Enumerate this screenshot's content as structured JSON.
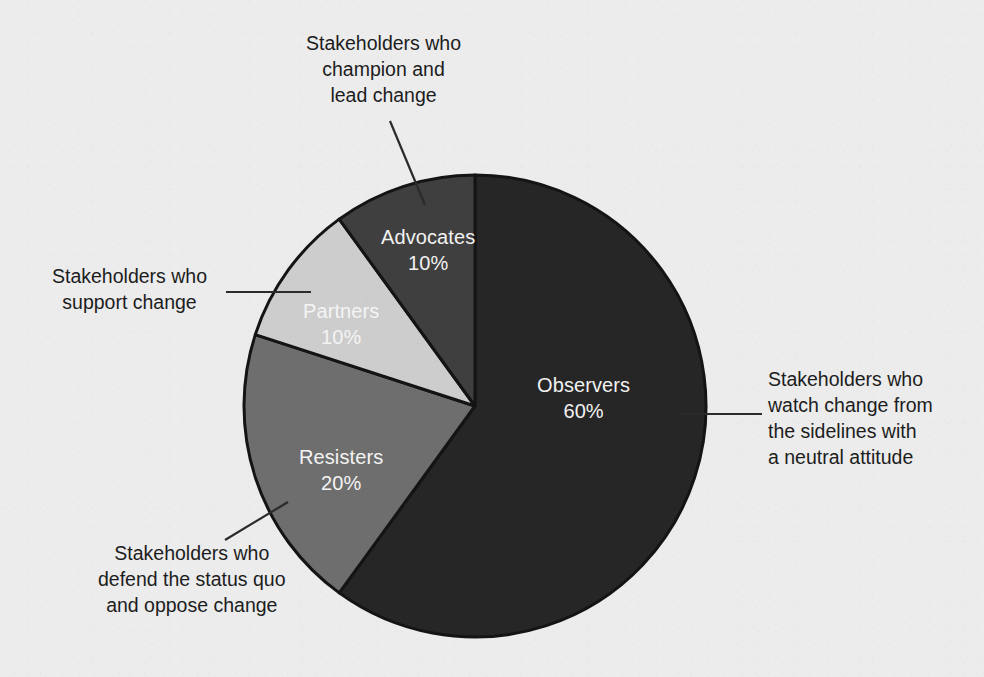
{
  "chart_data": {
    "type": "pie",
    "title": "",
    "subtitle": "",
    "xlabel": "",
    "ylabel": "",
    "grid": false,
    "legend_position": "none",
    "total_label": "100%",
    "categories": [
      "Observers",
      "Resisters",
      "Partners",
      "Advocates"
    ],
    "values": [
      60,
      20,
      10,
      10
    ],
    "value_labels": [
      "60%",
      "20%",
      "10%",
      "10%"
    ],
    "start_angle_deg": 0,
    "direction": "clockwise",
    "slices": [
      {
        "name": "Observers",
        "value": 60,
        "value_label": "60%",
        "color": "#262626",
        "label_color": "#f2f2f2",
        "start_deg": 0,
        "end_deg": 216,
        "annotation": {
          "lines": [
            "Stakeholders who",
            "watch change from",
            "the sidelines with",
            "a neutral attitude"
          ],
          "align": "left"
        }
      },
      {
        "name": "Resisters",
        "value": 20,
        "value_label": "20%",
        "color": "#6e6e6e",
        "label_color": "#f4f4f4",
        "start_deg": 216,
        "end_deg": 288,
        "annotation": {
          "lines": [
            "Stakeholders who",
            "defend the status quo",
            "and oppose change"
          ],
          "align": "center"
        }
      },
      {
        "name": "Partners",
        "value": 10,
        "value_label": "10%",
        "color": "#cdcdcd",
        "label_color": "#f8f8f8",
        "start_deg": 288,
        "end_deg": 324,
        "annotation": {
          "lines": [
            "Stakeholders who",
            "support change"
          ],
          "align": "center"
        }
      },
      {
        "name": "Advocates",
        "value": 10,
        "value_label": "10%",
        "color": "#3f3f3f",
        "label_color": "#f2f2f2",
        "start_deg": 324,
        "end_deg": 360,
        "annotation": {
          "lines": [
            "Stakeholders who",
            "champion and",
            "lead change"
          ],
          "align": "center"
        }
      }
    ],
    "colors": {
      "background": "#ececec",
      "slice_outline": "#141414",
      "leader_line": "#2b2b2b",
      "annotation_text": "#1d1d1d",
      "observers": "#262626",
      "resisters": "#6e6e6e",
      "partners": "#cdcdcd",
      "advocates": "#3f3f3f"
    },
    "geometry": {
      "center_x": 475,
      "center_y": 406,
      "radius": 231
    }
  },
  "slice_labels": {
    "observers": {
      "name": "Observers",
      "pct": "60%"
    },
    "resisters": {
      "name": "Resisters",
      "pct": "20%"
    },
    "partners": {
      "name": "Partners",
      "pct": "10%"
    },
    "advocates": {
      "name": "Advocates",
      "pct": "10%"
    }
  },
  "callouts": {
    "advocates": {
      "line1": "Stakeholders who",
      "line2": "champion and",
      "line3": "lead change"
    },
    "partners": {
      "line1": "Stakeholders who",
      "line2": "support change"
    },
    "resisters": {
      "line1": "Stakeholders who",
      "line2": "defend the status quo",
      "line3": "and oppose change"
    },
    "observers": {
      "line1": "Stakeholders who",
      "line2": "watch change from",
      "line3": "the sidelines with",
      "line4": "a neutral attitude"
    }
  }
}
